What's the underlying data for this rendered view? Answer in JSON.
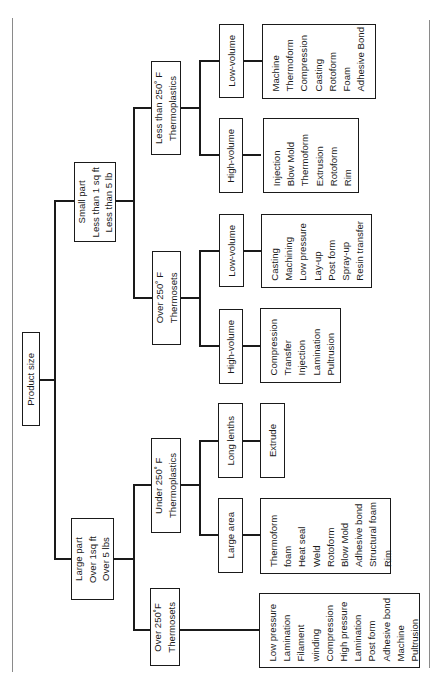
{
  "diagram": {
    "orientation": "rotated-90-ccw",
    "root": {
      "label": "Product size",
      "children": [
        {
          "label": "Small part\nLess than 1 sq ft\nLess than 5 lb",
          "children": [
            {
              "label": "Less than 250˚ F\nThermoplastics",
              "children": [
                {
                  "label": "Low-volume",
                  "processes": [
                    "Machine",
                    "Thermoform",
                    "Compression",
                    "Casting",
                    "Rotoform",
                    "Foam",
                    "Adhesive Bond"
                  ]
                },
                {
                  "label": "High-volume",
                  "processes": [
                    "Injection",
                    "Blow Mold",
                    "Thermoform",
                    "Extrusion",
                    "Rotoform",
                    "Rim"
                  ]
                }
              ]
            },
            {
              "label": "Over 250˚ F\nThermosets",
              "children": [
                {
                  "label": "Low-volume",
                  "processes": [
                    "Casting",
                    "Machining",
                    "Low pressure",
                    "Lay-up",
                    "Post form",
                    "Spray-up",
                    "Resin transfer"
                  ]
                },
                {
                  "label": "High-volume",
                  "processes": [
                    "Compression",
                    "Transfer",
                    "Injection",
                    "Lamination",
                    "Pultrusion"
                  ]
                }
              ]
            }
          ]
        },
        {
          "label": "Large part\nOver 1sq ft\nOver 5 lbs",
          "children": [
            {
              "label": "Under 250˚ F\nThermoplastics",
              "children": [
                {
                  "label": "Long lenths",
                  "processes": [
                    "Extrude"
                  ]
                },
                {
                  "label": "Large area",
                  "processes": [
                    "Thermoform",
                    "foam",
                    "Heat seal",
                    "Weld",
                    "Rotoform",
                    "Blow Mold",
                    "Adhesive bond",
                    "Structural foam",
                    "Rim"
                  ]
                }
              ]
            },
            {
              "label": "Over 250˚F\nThermosets",
              "processes": [
                "Low pressure",
                "Lamination",
                "Filament",
                "winding",
                "Compression",
                "High pressure",
                "Lamination",
                "Post form",
                "Adhesive bond",
                "Machine",
                "Pultrusion"
              ]
            }
          ]
        }
      ]
    }
  },
  "text": {
    "root": "Product size",
    "small_part": "Small part\nLess than 1 sq ft\nLess than 5 lb",
    "large_part": "Large part\nOver 1sq ft\nOver 5 lbs",
    "small_thermoplastics": "Less than 250˚ F\nThermoplastics",
    "small_thermosets": "Over 250˚ F\nThermosets",
    "large_thermoplastics": "Under 250˚ F\nThermoplastics",
    "large_thermosets": "Over 250˚F\nThermosets",
    "tp_low_volume": "Low-volume",
    "tp_high_volume": "High-volume",
    "ts_low_volume": "Low-volume",
    "ts_high_volume": "High-volume",
    "long_lengths": "Long lenths",
    "large_area": "Large area",
    "tp_low_volume_processes": "Machine\nThermoform\nCompression\nCasting\nRotoform\nFoam\nAdhesive Bond",
    "tp_high_volume_processes": "Injection\nBlow Mold\nThermoform\nExtrusion\nRotoform\nRim",
    "ts_low_volume_processes": "Casting\nMachining\nLow pressure\nLay-up\nPost form\nSpray-up\nResin transfer",
    "ts_high_volume_processes": "Compression\nTransfer\nInjection\nLamination\nPultrusion",
    "long_lengths_processes": "Extrude",
    "large_area_processes": "Thermoform\nfoam\nHeat seal\nWeld\nRotoform\nBlow Mold\nAdhesive bond\nStructural foam\nRim",
    "large_thermosets_processes": "Low pressure\nLamination\nFilament\nwinding\nCompression\nHigh pressure\nLamination\nPost form\nAdhesive bond\nMachine\nPultrusion"
  },
  "colors": {
    "line": "#1a1a1a",
    "background": "#ffffff",
    "page_edge": "#8a8a8a"
  }
}
